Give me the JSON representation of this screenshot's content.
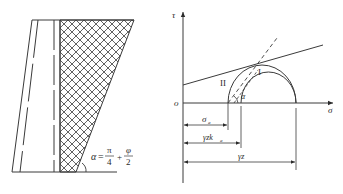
{
  "left_figure": {
    "angle_label": "α",
    "equals": "=",
    "pi_num": "π",
    "pi_den": "4",
    "plus": "+",
    "phi_num": "φ",
    "phi_den": "2"
  },
  "right_figure": {
    "y_axis_label": "τ",
    "x_axis_label": "σ",
    "origin_label": "o",
    "circle_I_label": "I",
    "circle_II_label": "II",
    "angle_label": "α",
    "dim_sigma_a": "σ",
    "dim_sigma_a_sub": "a",
    "dim_gzka": "γzk",
    "dim_gzka_sub": "a",
    "dim_gz": "γz"
  },
  "colors": {
    "line": "#3a3a3a",
    "hatch": "#3a3a3a",
    "background": "#ffffff"
  }
}
